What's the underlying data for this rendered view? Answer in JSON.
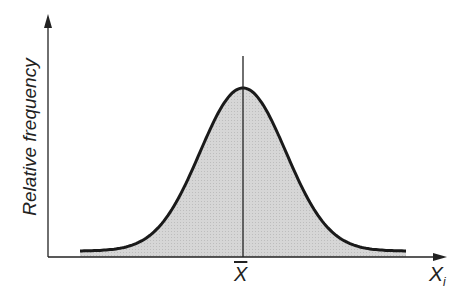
{
  "chart_data": {
    "type": "area",
    "title": "",
    "xlabel": "X_i",
    "ylabel": "Relative frequency",
    "mean_label": "X̄",
    "grid": false,
    "x": [
      -3.8,
      -3,
      -2,
      -1,
      0,
      1,
      2,
      3,
      3.8
    ],
    "values": [
      0.05,
      0.06,
      0.17,
      0.6,
      1.0,
      0.6,
      0.17,
      0.06,
      0.05
    ],
    "fill_color": "#d4d4d4",
    "line_color": "#1a1a1a"
  },
  "labels": {
    "ylabel": "Relative frequency",
    "mean": "X",
    "xvar": "X",
    "xsub": "i"
  }
}
